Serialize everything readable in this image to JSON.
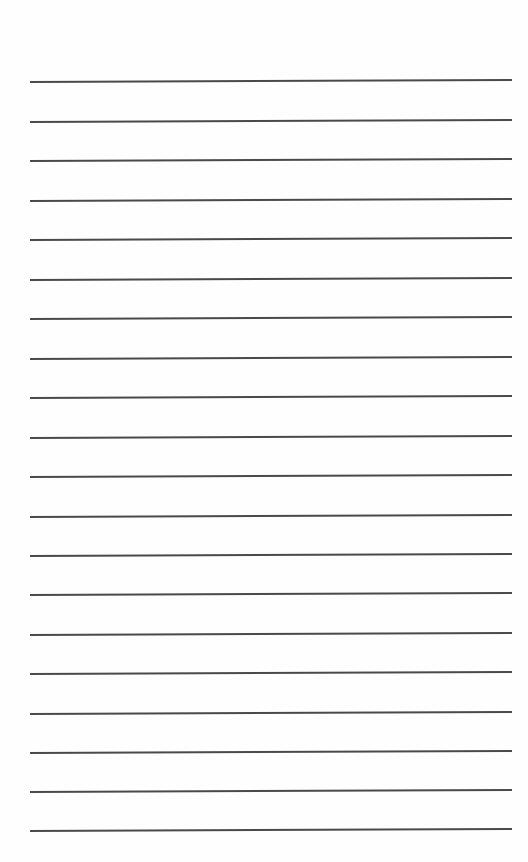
{
  "page": {
    "type": "lined-paper",
    "background_color": "#fefefe",
    "rule_color": "#4a4a4a",
    "rule_count": 20,
    "rules_y": [
      81,
      121,
      160,
      200,
      239,
      279,
      318,
      358,
      397,
      437,
      476,
      516,
      555,
      594,
      634,
      673,
      713,
      752,
      791,
      830
    ]
  }
}
